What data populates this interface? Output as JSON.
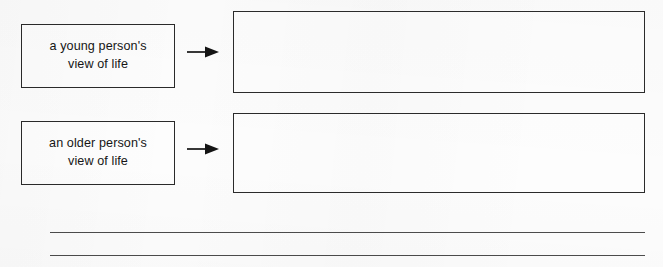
{
  "worksheet": {
    "background_color": "#fcfcfc",
    "ink_color": "#2a2a2a",
    "rows": [
      {
        "prompt": {
          "label": "a young person's\nview of life",
          "box": {
            "x": 21,
            "y": 24,
            "width": 154,
            "height": 64
          }
        },
        "connector": {
          "icon": "right-arrow-icon",
          "x": 187,
          "y": 52,
          "width": 32
        },
        "answer": {
          "value": "",
          "box": {
            "x": 233,
            "y": 11,
            "width": 412,
            "height": 82
          }
        }
      },
      {
        "prompt": {
          "label": "an older person's\nview of life",
          "box": {
            "x": 21,
            "y": 121,
            "width": 154,
            "height": 64
          }
        },
        "connector": {
          "icon": "right-arrow-icon",
          "x": 187,
          "y": 149,
          "width": 32
        },
        "answer": {
          "value": "",
          "box": {
            "x": 233,
            "y": 113,
            "width": 412,
            "height": 80
          }
        }
      }
    ],
    "writing_lines": [
      {
        "x": 50,
        "y": 232,
        "width": 595
      },
      {
        "x": 50,
        "y": 255,
        "width": 595
      }
    ]
  }
}
